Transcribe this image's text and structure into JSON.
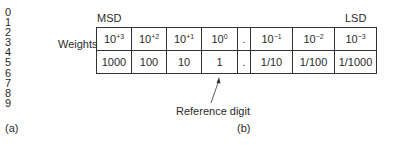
{
  "part_a": {
    "digits": [
      "0",
      "1",
      "2",
      "3",
      "4",
      "5",
      "6",
      "7",
      "8",
      "9"
    ],
    "caption": "(a)"
  },
  "part_b": {
    "msd_label": "MSD",
    "lsd_label": "LSD",
    "row_label": "Weights",
    "powers": [
      {
        "base": "10",
        "exp": "+3"
      },
      {
        "base": "10",
        "exp": "+2"
      },
      {
        "base": "10",
        "exp": "+1"
      },
      {
        "base": "10",
        "exp": "0"
      },
      {
        "base": ".",
        "exp": ""
      },
      {
        "base": "10",
        "exp": "−1"
      },
      {
        "base": "10",
        "exp": "−2"
      },
      {
        "base": "10",
        "exp": "−3"
      }
    ],
    "values": [
      "1000",
      "100",
      "10",
      "1",
      ".",
      "1/10",
      "1/100",
      "1/1000"
    ],
    "reference_label": "Reference digit",
    "caption": "(b)"
  }
}
